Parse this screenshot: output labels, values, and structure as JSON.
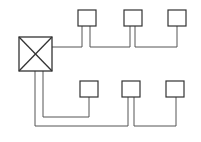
{
  "diagram": {
    "type": "network-topology",
    "colors": {
      "box_stroke": "#333333",
      "line_stroke": "#555555",
      "background": "#ffffff"
    },
    "hub": {
      "label": "",
      "icon": "crossed-box-icon",
      "x": 19,
      "y": 37,
      "w": 33,
      "h": 34
    },
    "top_nodes": [
      {
        "x": 78,
        "y": 10,
        "w": 18,
        "h": 16
      },
      {
        "x": 124,
        "y": 10,
        "w": 18,
        "h": 16
      },
      {
        "x": 168,
        "y": 10,
        "w": 18,
        "h": 16
      }
    ],
    "bottom_nodes": [
      {
        "x": 80,
        "y": 81,
        "w": 18,
        "h": 16
      },
      {
        "x": 122,
        "y": 81,
        "w": 18,
        "h": 16
      },
      {
        "x": 166,
        "y": 81,
        "w": 18,
        "h": 16
      }
    ]
  }
}
